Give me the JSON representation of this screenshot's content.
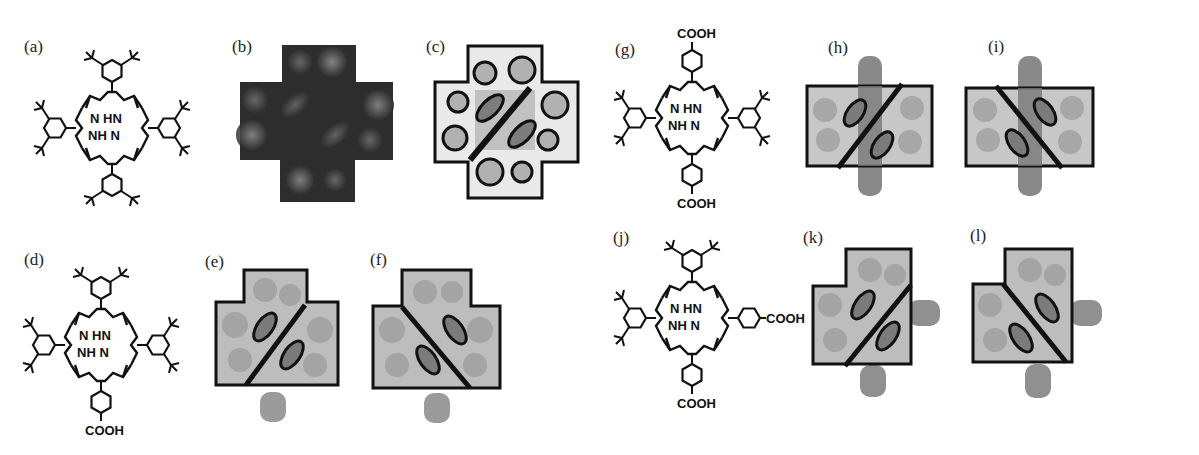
{
  "figure": {
    "panels": [
      {
        "id": "a",
        "label": "(a)",
        "type": "chemical-structure",
        "description": "Tetrakis(3,5-di-tert-butylphenyl)porphyrin",
        "atoms": [
          "N",
          "HN",
          "NH",
          "N"
        ]
      },
      {
        "id": "b",
        "label": "(b)",
        "type": "stm-image",
        "description": "Cross-shaped STM topograph"
      },
      {
        "id": "c",
        "label": "(c)",
        "type": "stm-model",
        "description": "Cross outline with circles and two ellipses, diagonal line /"
      },
      {
        "id": "d",
        "label": "(d)",
        "type": "chemical-structure",
        "substituent": "COOH"
      },
      {
        "id": "e",
        "label": "(e)",
        "type": "stm-model",
        "diagonal": "/"
      },
      {
        "id": "f",
        "label": "(f)",
        "type": "stm-model",
        "diagonal": "\\"
      },
      {
        "id": "g",
        "label": "(g)",
        "type": "chemical-structure",
        "substituents": [
          "COOH",
          "COOH"
        ]
      },
      {
        "id": "h",
        "label": "(h)",
        "type": "stm-model",
        "diagonal": "/"
      },
      {
        "id": "i",
        "label": "(i)",
        "type": "stm-model",
        "diagonal": "\\"
      },
      {
        "id": "j",
        "label": "(j)",
        "type": "chemical-structure",
        "substituents": [
          "COOH",
          "COOH"
        ]
      },
      {
        "id": "k",
        "label": "(k)",
        "type": "stm-model",
        "diagonal": "/"
      },
      {
        "id": "l",
        "label": "(l)",
        "type": "stm-model",
        "diagonal": "\\"
      }
    ],
    "chem_text": {
      "n_hn": "N HN",
      "nh_n": "NH N",
      "cooh": "COOH"
    },
    "colors": {
      "line": "#111111",
      "stm_dark": "#2a2a2a",
      "stm_light": "#7a7a7a",
      "molecule_fill": "#8a8a8a",
      "outline_fill": "#e6e6e6"
    }
  }
}
